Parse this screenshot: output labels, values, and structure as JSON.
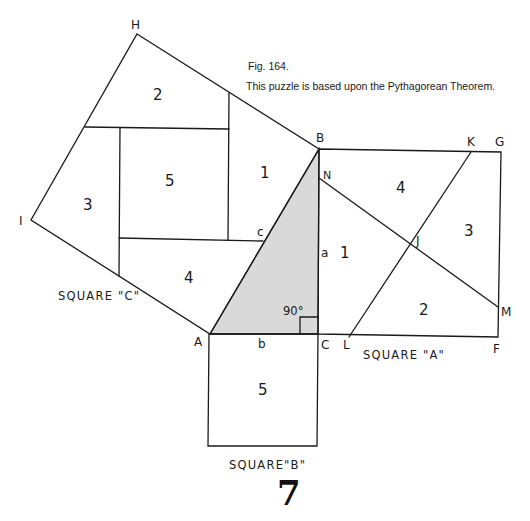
{
  "caption": {
    "figure": "Fig. 164.",
    "description": "This puzzle is based upon the Pythagorean Theorem."
  },
  "vertices": {
    "H": "H",
    "B": "B",
    "I": "I",
    "A": "A",
    "C": "C",
    "K": "K",
    "G": "G",
    "N": "N",
    "J": "J",
    "M": "M",
    "L": "L",
    "F": "F"
  },
  "triangle_sides": {
    "a": "a",
    "b": "b",
    "c": "c"
  },
  "right_angle": "90°",
  "square_labels": {
    "A": "SQUARE \"A\"",
    "B": "SQUARE\"B\"",
    "C": "SQUARE \"C\""
  },
  "pieces": {
    "square_c": [
      "2",
      "5",
      "1",
      "3",
      "4"
    ],
    "square_a": [
      "4",
      "1",
      "3",
      "2"
    ],
    "square_b": [
      "5"
    ]
  },
  "page_number": "7",
  "colors": {
    "line": "#1a1a1a",
    "triangle_fill": "#d9d9d9",
    "background": "#ffffff"
  }
}
